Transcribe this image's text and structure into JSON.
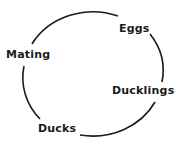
{
  "diagram": {
    "type": "cycle",
    "stroke_color": "#1a1a1a",
    "stages": [
      {
        "label": "Eggs"
      },
      {
        "label": "Ducklings"
      },
      {
        "label": "Ducks"
      },
      {
        "label": "Mating"
      }
    ]
  }
}
